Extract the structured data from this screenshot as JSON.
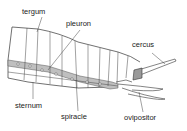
{
  "diagram": {
    "labels": {
      "tergum": "tergum",
      "pleuron": "pleuron",
      "cercus": "cercus",
      "sternum": "sternum",
      "spiracle": "spiracle",
      "ovipositor": "ovipositor"
    },
    "colors": {
      "outline": "#333333",
      "pleuron_band": "#bfbfbf",
      "spiracle_fill": "#e8e8e8",
      "label_text": "#222222",
      "background": "#ffffff"
    }
  }
}
